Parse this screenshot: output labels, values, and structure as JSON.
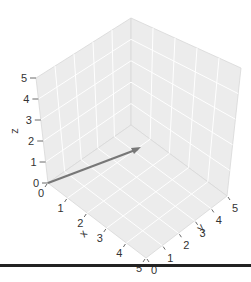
{
  "chart_data": {
    "type": "3d-quiver",
    "title": "",
    "xlabel": "x",
    "ylabel": "y",
    "zlabel": "z",
    "xlim": [
      0,
      5
    ],
    "ylim": [
      0,
      5
    ],
    "zlim": [
      0,
      5
    ],
    "x_ticks": [
      "0",
      "1",
      "2",
      "3",
      "4",
      "5"
    ],
    "y_ticks": [
      "0",
      "1",
      "2",
      "3",
      "4",
      "5"
    ],
    "z_ticks": [
      "0",
      "1",
      "2",
      "3",
      "4",
      "5"
    ],
    "grid": true,
    "vectors": [
      {
        "start": [
          0,
          0,
          0
        ],
        "end": [
          0,
          4,
          1
        ],
        "label": "",
        "color": "#777777"
      }
    ],
    "pane_color": "#ececec",
    "grid_color": "#ffffff"
  }
}
